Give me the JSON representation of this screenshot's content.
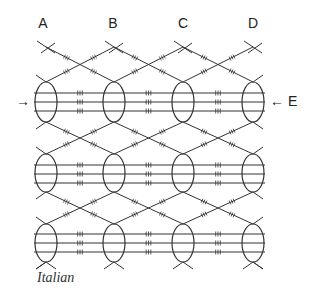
{
  "columns": [
    {
      "label": "A",
      "x": 46
    },
    {
      "label": "B",
      "x": 114
    },
    {
      "label": "C",
      "x": 183
    },
    {
      "label": "D",
      "x": 253
    }
  ],
  "left_arrow": {
    "glyph": "→",
    "y": 102
  },
  "right_arrow": {
    "glyph": "← E",
    "y": 102
  },
  "caption": "Italian",
  "rows": [
    {
      "center_y": 102,
      "ry": 20,
      "lines_y": [
        93,
        102,
        111
      ]
    },
    {
      "center_y": 173,
      "ry": 19,
      "lines_y": [
        165,
        174,
        183
      ]
    },
    {
      "center_y": 243,
      "ry": 19,
      "lines_y": [
        234,
        243,
        252
      ]
    }
  ],
  "ellipse_rx": 11,
  "top_y": 47,
  "bottom_y": 268,
  "colors": {
    "stroke": "#333333",
    "background": "#ffffff"
  }
}
